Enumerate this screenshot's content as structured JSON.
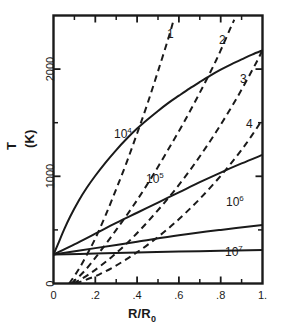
{
  "chart_data": {
    "type": "line",
    "title": "",
    "xlabel": "R/R0",
    "xlabel_display": "R/R₀",
    "ylabel": "T  (K)",
    "ylabel_main": "T",
    "ylabel_unit": "(K)",
    "xlim": [
      0,
      1.0
    ],
    "ylim": [
      0,
      2500
    ],
    "grid": false,
    "legend": "inline-curve-labels",
    "xticks": [
      0,
      0.2,
      0.4,
      0.6,
      0.8,
      1.0
    ],
    "xtick_labels": [
      "0",
      ".2",
      ".4",
      ".6",
      ".8",
      "1."
    ],
    "xminor_ticks": [
      0.1,
      0.3,
      0.5,
      0.7,
      0.9
    ],
    "yticks": [
      0,
      1000,
      2000
    ],
    "ytick_labels": [
      "0",
      "1000",
      "2000"
    ],
    "yminor_ticks": [
      500,
      1500,
      2500
    ],
    "series": [
      {
        "name": "10^4",
        "label": "10",
        "exponent": "4",
        "style": "solid",
        "label_x": 0.2,
        "label_y": 1480,
        "points": [
          [
            0.0,
            270
          ],
          [
            0.02,
            360
          ],
          [
            0.05,
            500
          ],
          [
            0.08,
            625
          ],
          [
            0.12,
            770
          ],
          [
            0.16,
            895
          ],
          [
            0.2,
            1005
          ],
          [
            0.25,
            1130
          ],
          [
            0.3,
            1245
          ],
          [
            0.35,
            1350
          ],
          [
            0.4,
            1445
          ],
          [
            0.45,
            1530
          ],
          [
            0.5,
            1610
          ],
          [
            0.55,
            1685
          ],
          [
            0.6,
            1752
          ],
          [
            0.65,
            1818
          ],
          [
            0.7,
            1880
          ],
          [
            0.75,
            1940
          ],
          [
            0.8,
            1995
          ],
          [
            0.85,
            2045
          ],
          [
            0.9,
            2090
          ],
          [
            0.95,
            2135
          ],
          [
            1.0,
            2175
          ]
        ]
      },
      {
        "name": "10^5",
        "label": "10",
        "exponent": "5",
        "style": "solid",
        "label_x": 0.51,
        "label_y": 930,
        "points": [
          [
            0.0,
            270
          ],
          [
            0.1,
            365
          ],
          [
            0.2,
            465
          ],
          [
            0.3,
            565
          ],
          [
            0.4,
            660
          ],
          [
            0.5,
            755
          ],
          [
            0.6,
            850
          ],
          [
            0.7,
            945
          ],
          [
            0.8,
            1035
          ],
          [
            0.9,
            1120
          ],
          [
            1.0,
            1200
          ]
        ]
      },
      {
        "name": "10^6",
        "label": "10",
        "exponent": "6",
        "style": "solid",
        "label_x": 0.795,
        "label_y": 730,
        "points": [
          [
            0.0,
            270
          ],
          [
            0.2,
            330
          ],
          [
            0.4,
            390
          ],
          [
            0.6,
            450
          ],
          [
            0.8,
            500
          ],
          [
            1.0,
            545
          ]
        ]
      },
      {
        "name": "10^7",
        "label": "10",
        "exponent": "7",
        "style": "solid",
        "label_x": 0.79,
        "label_y": 290,
        "points": [
          [
            0.0,
            270
          ],
          [
            0.2,
            280
          ],
          [
            0.4,
            290
          ],
          [
            0.6,
            298
          ],
          [
            0.8,
            305
          ],
          [
            1.0,
            312
          ]
        ]
      },
      {
        "name": "1",
        "label": "1",
        "style": "dashed",
        "label_x": 0.415,
        "label_y": 2230,
        "points": [
          [
            0.075,
            0
          ],
          [
            0.12,
            130
          ],
          [
            0.16,
            270
          ],
          [
            0.2,
            420
          ],
          [
            0.25,
            640
          ],
          [
            0.3,
            880
          ],
          [
            0.35,
            1130
          ],
          [
            0.4,
            1400
          ],
          [
            0.45,
            1680
          ],
          [
            0.5,
            1980
          ],
          [
            0.55,
            2290
          ],
          [
            0.575,
            2460
          ]
        ]
      },
      {
        "name": "2",
        "label": "2",
        "style": "dashed",
        "label_x": 0.71,
        "label_y": 2150,
        "points": [
          [
            0.085,
            0
          ],
          [
            0.15,
            120
          ],
          [
            0.22,
            290
          ],
          [
            0.3,
            500
          ],
          [
            0.38,
            720
          ],
          [
            0.46,
            960
          ],
          [
            0.54,
            1220
          ],
          [
            0.62,
            1490
          ],
          [
            0.7,
            1780
          ],
          [
            0.78,
            2090
          ],
          [
            0.845,
            2375
          ],
          [
            0.865,
            2460
          ]
        ]
      },
      {
        "name": "3",
        "label": "3",
        "style": "dashed",
        "label_x": 0.885,
        "label_y": 1740,
        "points": [
          [
            0.095,
            0
          ],
          [
            0.18,
            100
          ],
          [
            0.28,
            250
          ],
          [
            0.38,
            430
          ],
          [
            0.48,
            640
          ],
          [
            0.58,
            870
          ],
          [
            0.68,
            1130
          ],
          [
            0.78,
            1420
          ],
          [
            0.88,
            1740
          ],
          [
            0.97,
            2060
          ],
          [
            1.0,
            2180
          ]
        ]
      },
      {
        "name": "4",
        "label": "4",
        "style": "dashed",
        "label_x": 0.945,
        "label_y": 1250,
        "points": [
          [
            0.105,
            0
          ],
          [
            0.22,
            85
          ],
          [
            0.34,
            215
          ],
          [
            0.46,
            375
          ],
          [
            0.58,
            565
          ],
          [
            0.7,
            790
          ],
          [
            0.82,
            1050
          ],
          [
            0.92,
            1300
          ],
          [
            1.0,
            1530
          ]
        ]
      }
    ]
  },
  "curve_labels": [
    {
      "id": "label-10e4",
      "text": "10",
      "sup": "4",
      "left": 114,
      "top": 128
    },
    {
      "id": "label-10e5",
      "text": "10",
      "sup": "5",
      "left": 146,
      "top": 173
    },
    {
      "id": "label-10e6",
      "text": "10",
      "sup": "6",
      "left": 226,
      "top": 196
    },
    {
      "id": "label-10e7",
      "text": "10",
      "sup": "7",
      "left": 225,
      "top": 246
    }
  ],
  "dash_labels": [
    {
      "id": "label-curve-1",
      "text": "1",
      "left": 167,
      "top": 27
    },
    {
      "id": "label-curve-2",
      "text": "2",
      "left": 219,
      "top": 33
    },
    {
      "id": "label-curve-3",
      "text": "3",
      "left": 240,
      "top": 72
    },
    {
      "id": "label-curve-4",
      "text": "4",
      "left": 246,
      "top": 117
    }
  ]
}
